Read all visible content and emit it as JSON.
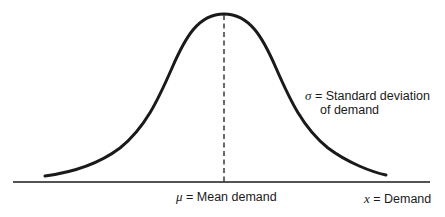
{
  "diagram": {
    "type": "normal distribution curve",
    "sigma_label": {
      "symbol": "σ",
      "text_line1": " = Standard deviation",
      "text_line2": "of demand"
    },
    "mean_label": {
      "symbol": "μ",
      "text": " = Mean demand"
    },
    "x_label": {
      "symbol": "x",
      "text": " = Demand"
    },
    "colors": {
      "line": "#1a1a1a",
      "background": "#ffffff"
    }
  }
}
